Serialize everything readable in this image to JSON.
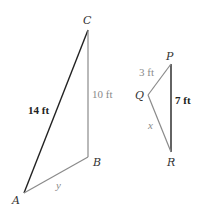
{
  "colors": {
    "dark_edge": "#222222",
    "grey_edge": "#8a8a8a",
    "background": "#ffffff"
  },
  "triangle_abc": {
    "vertices": {
      "A": {
        "label": "A",
        "x": 24,
        "y": 193
      },
      "B": {
        "label": "B",
        "x": 88,
        "y": 157
      },
      "C": {
        "label": "C",
        "x": 88,
        "y": 30
      }
    },
    "edges": {
      "AC": {
        "label": "14 ft",
        "style": "dark"
      },
      "CB": {
        "label": "10 ft",
        "style": "grey"
      },
      "AB": {
        "label": "y",
        "style": "grey"
      }
    }
  },
  "triangle_pqr": {
    "vertices": {
      "P": {
        "label": "P",
        "x": 171,
        "y": 64
      },
      "Q": {
        "label": "Q",
        "x": 148,
        "y": 95
      },
      "R": {
        "label": "R",
        "x": 171,
        "y": 152
      }
    },
    "edges": {
      "PR": {
        "label": "7 ft",
        "style": "dark"
      },
      "PQ": {
        "label": "3 ft",
        "style": "grey"
      },
      "QR": {
        "label": "x",
        "style": "grey"
      }
    }
  }
}
